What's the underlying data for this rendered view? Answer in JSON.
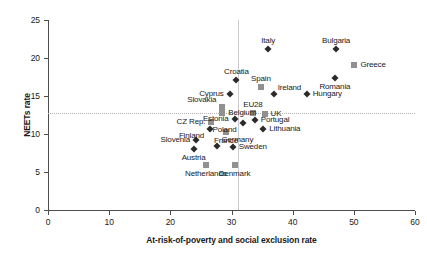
{
  "chart_data": {
    "type": "scatter",
    "title": "",
    "xlabel": "At-risk-of-poverty and social exclusion rate",
    "ylabel": "NEETs rate",
    "xlim": [
      0,
      60
    ],
    "ylim": [
      0,
      25
    ],
    "xticks": [
      0,
      10,
      20,
      30,
      40,
      50,
      60
    ],
    "yticks": [
      0,
      5,
      10,
      15,
      20,
      25
    ],
    "xtick_labels": [
      "0",
      "10",
      "20",
      "30",
      "40",
      "50",
      "60"
    ],
    "ytick_labels": [
      "0",
      "5",
      "10",
      "15",
      "20",
      "25"
    ],
    "grid": false,
    "legend": "none",
    "reference_lines": [
      {
        "orientation": "horizontal",
        "value": 12.8,
        "style": "dotted",
        "color": "#b3b3b3"
      },
      {
        "orientation": "vertical",
        "value": 31.0,
        "style": "solid",
        "color": "#cccccc"
      }
    ],
    "marker_styles": {
      "diamond": {
        "shape": "diamond",
        "color": "#2b2b2b"
      },
      "square": {
        "shape": "square",
        "color": "#909090"
      }
    },
    "points": [
      {
        "label": "Italy",
        "x": 36.0,
        "y": 21.2,
        "marker": "diamond",
        "label_pos": "above"
      },
      {
        "label": "Bulgaria",
        "x": 47.1,
        "y": 21.2,
        "marker": "diamond",
        "label_pos": "above"
      },
      {
        "label": "Greece",
        "x": 50.1,
        "y": 19.1,
        "marker": "square",
        "label_pos": "right"
      },
      {
        "label": "Romania",
        "x": 46.9,
        "y": 17.4,
        "marker": "diamond",
        "label_pos": "below"
      },
      {
        "label": "Croatia",
        "x": 30.8,
        "y": 17.1,
        "marker": "diamond",
        "label_pos": "above"
      },
      {
        "label": "Spain",
        "x": 34.8,
        "y": 16.2,
        "marker": "square",
        "label_pos": "above"
      },
      {
        "label": "Ireland",
        "x": 36.9,
        "y": 15.2,
        "marker": "diamond",
        "label_pos": "above-right"
      },
      {
        "label": "Cyprus",
        "x": 29.7,
        "y": 15.2,
        "marker": "diamond",
        "label_pos": "left"
      },
      {
        "label": "Hungary",
        "x": 42.3,
        "y": 15.2,
        "marker": "diamond",
        "label_pos": "right"
      },
      {
        "label": "Slovakia",
        "x": 28.5,
        "y": 13.6,
        "marker": "square",
        "label_pos": "above-left"
      },
      {
        "label": "Belgium",
        "x": 28.5,
        "y": 12.7,
        "marker": "square",
        "label_pos": "right"
      },
      {
        "label": "EU28",
        "x": 33.5,
        "y": 12.8,
        "marker": "square",
        "label_pos": "above"
      },
      {
        "label": "UK",
        "x": 35.4,
        "y": 12.6,
        "marker": "square",
        "label_pos": "right"
      },
      {
        "label": "Estonia",
        "x": 30.5,
        "y": 12.0,
        "marker": "diamond",
        "label_pos": "left"
      },
      {
        "label": "Portugal",
        "x": 33.8,
        "y": 11.9,
        "marker": "diamond",
        "label_pos": "right"
      },
      {
        "label": "Poland",
        "x": 31.8,
        "y": 11.5,
        "marker": "diamond",
        "label_pos": "below-left"
      },
      {
        "label": "CZ Rep.",
        "x": 26.7,
        "y": 11.6,
        "marker": "square",
        "label_pos": "left"
      },
      {
        "label": "Lithuania",
        "x": 35.2,
        "y": 10.7,
        "marker": "diamond",
        "label_pos": "right"
      },
      {
        "label": "Finland",
        "x": 26.5,
        "y": 10.6,
        "marker": "diamond",
        "label_pos": "below-left"
      },
      {
        "label": "France",
        "x": 29.1,
        "y": 10.3,
        "marker": "square",
        "label_pos": "below"
      },
      {
        "label": "Slovenia",
        "x": 24.2,
        "y": 9.2,
        "marker": "diamond",
        "label_pos": "left"
      },
      {
        "label": "Germany",
        "x": 27.7,
        "y": 8.4,
        "marker": "diamond",
        "label_pos": "above-right"
      },
      {
        "label": "Sweden",
        "x": 30.2,
        "y": 8.3,
        "marker": "diamond",
        "label_pos": "right"
      },
      {
        "label": "Austria",
        "x": 23.8,
        "y": 8.0,
        "marker": "diamond",
        "label_pos": "below"
      },
      {
        "label": "Netherlands",
        "x": 25.8,
        "y": 5.9,
        "marker": "square",
        "label_pos": "below"
      },
      {
        "label": "Denmark",
        "x": 30.5,
        "y": 5.9,
        "marker": "square",
        "label_pos": "below"
      }
    ]
  }
}
